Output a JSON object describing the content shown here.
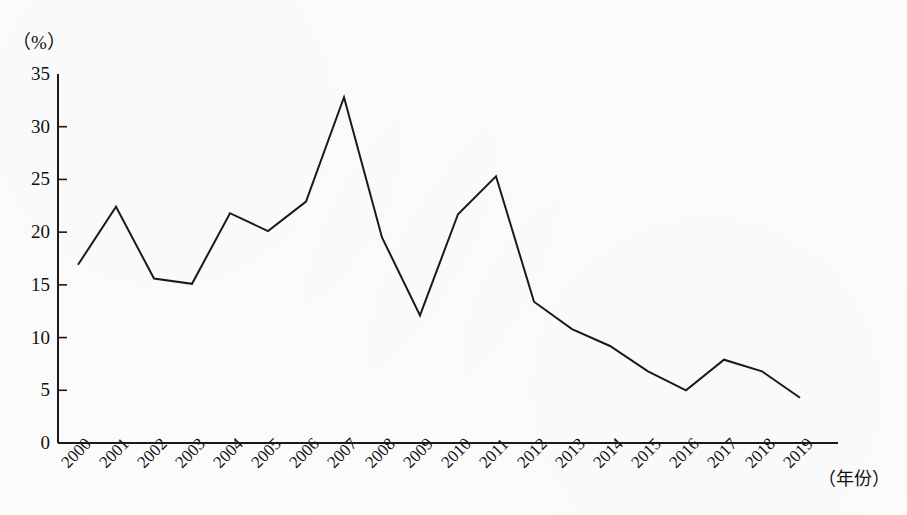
{
  "page": {
    "background_color": "#fcfcfc",
    "ink_color": "#1a1a1a",
    "top_cut_text": "                                                                "
  },
  "axes": {
    "y_unit_label": "（%）",
    "x_unit_label": "（年份）",
    "y_ticks": [
      "0",
      "5",
      "10",
      "15",
      "20",
      "25",
      "30",
      "35"
    ],
    "x_ticks": [
      "2000",
      "2001",
      "2002",
      "2003",
      "2004",
      "2005",
      "2006",
      "2007",
      "2008",
      "2009",
      "2010",
      "2011",
      "2012",
      "2013",
      "2014",
      "2015",
      "2016",
      "2017",
      "2018",
      "2019"
    ]
  },
  "chart_data": {
    "type": "line",
    "title": "",
    "subtitle": "",
    "xlabel": "（年份）",
    "ylabel": "（%）",
    "xlim": [
      2000,
      2019
    ],
    "ylim": [
      0,
      35
    ],
    "ytick_step": 5,
    "grid": false,
    "legend": false,
    "legend_position": "none",
    "line_color": "#1a1a1a",
    "line_width": 2,
    "markers": false,
    "x": [
      2000,
      2001,
      2002,
      2003,
      2004,
      2005,
      2006,
      2007,
      2008,
      2009,
      2010,
      2011,
      2012,
      2013,
      2014,
      2015,
      2016,
      2017,
      2018,
      2019
    ],
    "categories": [
      "2000",
      "2001",
      "2002",
      "2003",
      "2004",
      "2005",
      "2006",
      "2007",
      "2008",
      "2009",
      "2010",
      "2011",
      "2012",
      "2013",
      "2014",
      "2015",
      "2016",
      "2017",
      "2018",
      "2019"
    ],
    "values": [
      16.9,
      22.4,
      15.6,
      15.1,
      21.8,
      20.1,
      22.9,
      32.8,
      19.5,
      12.1,
      21.7,
      25.3,
      13.4,
      10.8,
      9.2,
      6.8,
      5.0,
      7.9,
      6.8,
      4.3
    ],
    "series": [
      {
        "name": "",
        "values": [
          16.9,
          22.4,
          15.6,
          15.1,
          21.8,
          20.1,
          22.9,
          32.8,
          19.5,
          12.1,
          21.7,
          25.3,
          13.4,
          10.8,
          9.2,
          6.8,
          5.0,
          7.9,
          6.8,
          4.3
        ]
      }
    ],
    "annotations": []
  },
  "geometry": {
    "plot_left": 58,
    "plot_right": 838,
    "plot_baseline_y": 443,
    "plot_top_y": 74,
    "first_point_x": 78,
    "last_point_x": 800
  }
}
